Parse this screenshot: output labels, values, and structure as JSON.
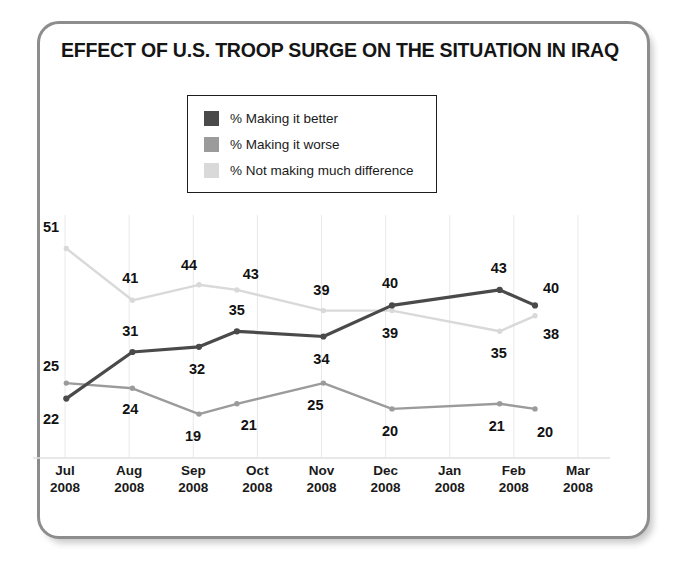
{
  "figure": {
    "title": "EFFECT OF U.S. TROOP SURGE ON THE SITUATION IN IRAQ"
  },
  "legend": {
    "items": [
      {
        "label": "% Making it better",
        "color": "#4a4a4a",
        "name": "legend-making-it-better"
      },
      {
        "label": "% Making it worse",
        "color": "#9b9b9b",
        "name": "legend-making-it-worse"
      },
      {
        "label": "% Not making much difference",
        "color": "#d9d9d9",
        "name": "legend-not-making-much-difference"
      }
    ]
  },
  "chart_data": {
    "type": "line",
    "title": "EFFECT OF U.S. TROOP SURGE ON THE SITUATION IN IRAQ",
    "xlabel": "",
    "ylabel": "",
    "ylim": [
      0,
      60
    ],
    "grid": true,
    "legend_position": "top-center",
    "axis_categories": [
      "Jul 2008",
      "Aug 2008",
      "Sep 2008",
      "Oct 2008",
      "Nov 2008",
      "Dec 2008",
      "Jan 2008",
      "Feb 2008",
      "Mar 2008"
    ],
    "axis_tick_lines": [
      {
        "month": "Jul",
        "year": "2008"
      },
      {
        "month": "Aug",
        "year": "2008"
      },
      {
        "month": "Sep",
        "year": "2008"
      },
      {
        "month": "Oct",
        "year": "2008"
      },
      {
        "month": "Nov",
        "year": "2008"
      },
      {
        "month": "Dec",
        "year": "2008"
      },
      {
        "month": "Jan",
        "year": "2008"
      },
      {
        "month": "Feb",
        "year": "2008"
      },
      {
        "month": "Mar",
        "year": "2008"
      }
    ],
    "x_positions": [
      0.5,
      1.5,
      2.5,
      3.5,
      4.5,
      5.5,
      6.5,
      7.5,
      8.5
    ],
    "series": [
      {
        "name": "% Making it better",
        "color": "#4a4a4a",
        "points": [
          {
            "x": 0.52,
            "value": 22
          },
          {
            "x": 1.55,
            "value": 31
          },
          {
            "x": 2.59,
            "value": 32
          },
          {
            "x": 3.18,
            "value": 35
          },
          {
            "x": 4.53,
            "value": 34
          },
          {
            "x": 5.6,
            "value": 40
          },
          {
            "x": 7.28,
            "value": 43
          },
          {
            "x": 7.83,
            "value": 40
          }
        ],
        "values": [
          22,
          31,
          32,
          35,
          34,
          40,
          43,
          40
        ]
      },
      {
        "name": "% Making it worse",
        "color": "#9b9b9b",
        "points": [
          {
            "x": 0.52,
            "value": 25
          },
          {
            "x": 1.55,
            "value": 24
          },
          {
            "x": 2.59,
            "value": 19
          },
          {
            "x": 3.18,
            "value": 21
          },
          {
            "x": 4.53,
            "value": 25
          },
          {
            "x": 5.6,
            "value": 20
          },
          {
            "x": 7.28,
            "value": 21
          },
          {
            "x": 7.83,
            "value": 20
          }
        ],
        "values": [
          25,
          24,
          19,
          21,
          25,
          20,
          21,
          20
        ]
      },
      {
        "name": "% Not making much difference",
        "color": "#d9d9d9",
        "points": [
          {
            "x": 0.52,
            "value": 51
          },
          {
            "x": 1.55,
            "value": 41
          },
          {
            "x": 2.59,
            "value": 44
          },
          {
            "x": 3.18,
            "value": 43
          },
          {
            "x": 4.53,
            "value": 39
          },
          {
            "x": 5.6,
            "value": 39
          },
          {
            "x": 7.28,
            "value": 35
          },
          {
            "x": 7.83,
            "value": 38
          }
        ],
        "values": [
          51,
          41,
          44,
          43,
          39,
          39,
          35,
          38
        ]
      }
    ],
    "data_labels": [
      {
        "text": "51",
        "x": 0.5,
        "value": 51,
        "dx": -14,
        "dy": -22,
        "series": "% Not making much difference"
      },
      {
        "text": "25",
        "x": 0.5,
        "value": 25,
        "dx": -14,
        "dy": -17,
        "series": "% Making it worse"
      },
      {
        "text": "22",
        "x": 0.5,
        "value": 22,
        "dx": -14,
        "dy": 20,
        "series": "% Making it better"
      },
      {
        "text": "41",
        "x": 1.55,
        "value": 41,
        "dx": -2,
        "dy": -22,
        "series": "% Not making much difference"
      },
      {
        "text": "31",
        "x": 1.55,
        "value": 31,
        "dx": -2,
        "dy": -21,
        "series": "% Making it better"
      },
      {
        "text": "24",
        "x": 1.55,
        "value": 24,
        "dx": -2,
        "dy": 21,
        "series": "% Making it worse"
      },
      {
        "text": "44",
        "x": 2.59,
        "value": 44,
        "dx": -10,
        "dy": -20,
        "series": "% Not making much difference"
      },
      {
        "text": "32",
        "x": 2.59,
        "value": 32,
        "dx": -2,
        "dy": 22,
        "series": "% Making it better"
      },
      {
        "text": "19",
        "x": 2.59,
        "value": 19,
        "dx": -6,
        "dy": 22,
        "series": "% Making it worse"
      },
      {
        "text": "43",
        "x": 3.18,
        "value": 43,
        "dx": 14,
        "dy": -16,
        "series": "% Not making much difference"
      },
      {
        "text": "35",
        "x": 3.18,
        "value": 35,
        "dx": 0,
        "dy": -21,
        "series": "% Making it better"
      },
      {
        "text": "21",
        "x": 3.18,
        "value": 21,
        "dx": 12,
        "dy": 21,
        "series": "% Making it worse"
      },
      {
        "text": "39",
        "x": 4.53,
        "value": 39,
        "dx": -2,
        "dy": -21,
        "series": "% Not making much difference"
      },
      {
        "text": "34",
        "x": 4.53,
        "value": 34,
        "dx": -2,
        "dy": 22,
        "series": "% Making it better"
      },
      {
        "text": "25",
        "x": 4.53,
        "value": 25,
        "dx": -8,
        "dy": 22,
        "series": "% Making it worse"
      },
      {
        "text": "40",
        "x": 5.6,
        "value": 40,
        "dx": -2,
        "dy": -22,
        "series": "% Making it better"
      },
      {
        "text": "39",
        "x": 5.6,
        "value": 39,
        "dx": -2,
        "dy": 22,
        "series": "% Not making much difference"
      },
      {
        "text": "20",
        "x": 5.6,
        "value": 20,
        "dx": -2,
        "dy": 22,
        "series": "% Making it worse"
      },
      {
        "text": "43",
        "x": 7.28,
        "value": 43,
        "dx": -1,
        "dy": -22,
        "series": "% Making it better"
      },
      {
        "text": "35",
        "x": 7.28,
        "value": 35,
        "dx": -1,
        "dy": 22,
        "series": "% Not making much difference"
      },
      {
        "text": "21",
        "x": 7.28,
        "value": 21,
        "dx": -3,
        "dy": 22,
        "series": "% Making it worse"
      },
      {
        "text": "40",
        "x": 7.83,
        "value": 40,
        "dx": 16,
        "dy": -17,
        "series": "% Making it better"
      },
      {
        "text": "38",
        "x": 7.83,
        "value": 38,
        "dx": 16,
        "dy": 18,
        "series": "% Not making much difference"
      },
      {
        "text": "20",
        "x": 7.83,
        "value": 20,
        "dx": 10,
        "dy": 23,
        "series": "% Making it worse"
      }
    ]
  },
  "colors": {
    "frame_border": "#8d8d8d",
    "gridline": "#e9e9e9",
    "axis_line": "#e0e0e0",
    "text": "#151515"
  }
}
